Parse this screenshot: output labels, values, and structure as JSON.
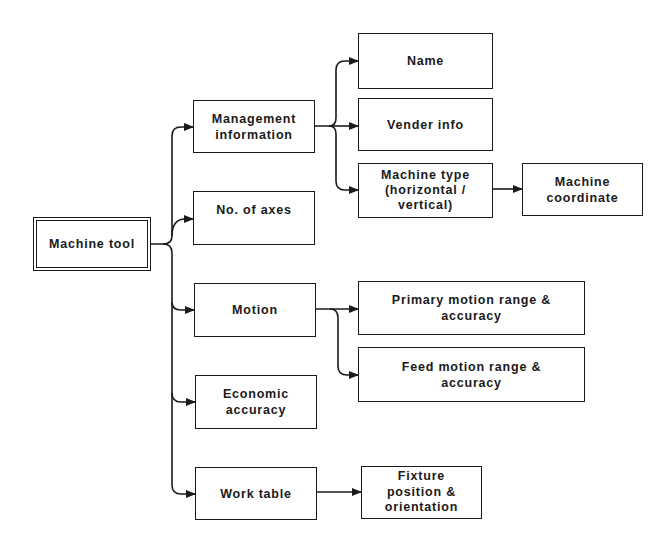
{
  "diagram": {
    "type": "tree",
    "root": "Machine tool",
    "nodes": [
      {
        "id": "machine-tool",
        "label": "Machine tool",
        "x": 33,
        "y": 217,
        "w": 118,
        "h": 54,
        "root": true
      },
      {
        "id": "management-information",
        "label": "Management\ninformation",
        "x": 193,
        "y": 100,
        "w": 122,
        "h": 53
      },
      {
        "id": "no-of-axes",
        "label": "No. of axes",
        "x": 193,
        "y": 191,
        "w": 122,
        "h": 54,
        "valign": "top"
      },
      {
        "id": "motion",
        "label": "Motion",
        "x": 194,
        "y": 283,
        "w": 122,
        "h": 54
      },
      {
        "id": "economic-accuracy",
        "label": "Economic\naccuracy",
        "x": 195,
        "y": 375,
        "w": 122,
        "h": 54
      },
      {
        "id": "work-table",
        "label": "Work table",
        "x": 195,
        "y": 467,
        "w": 122,
        "h": 53
      },
      {
        "id": "name",
        "label": "Name",
        "x": 358,
        "y": 33,
        "w": 135,
        "h": 56
      },
      {
        "id": "vender-info",
        "label": "Vender info",
        "x": 358,
        "y": 98,
        "w": 135,
        "h": 53
      },
      {
        "id": "machine-type",
        "label": "Machine type\n(horizontal /\nvertical)",
        "x": 358,
        "y": 163,
        "w": 135,
        "h": 55
      },
      {
        "id": "machine-coordinate",
        "label": "Machine\ncoordinate",
        "x": 522,
        "y": 163,
        "w": 121,
        "h": 53
      },
      {
        "id": "primary-motion",
        "label": "Primary motion range  &\naccuracy",
        "x": 358,
        "y": 281,
        "w": 227,
        "h": 54
      },
      {
        "id": "feed-motion",
        "label": "Feed motion range  &\naccuracy",
        "x": 358,
        "y": 347,
        "w": 227,
        "h": 55
      },
      {
        "id": "fixture",
        "label": "Fixture\nposition &\norientation",
        "x": 361,
        "y": 466,
        "w": 121,
        "h": 53
      }
    ],
    "edges": [
      {
        "from": "machine-tool",
        "to": "management-information"
      },
      {
        "from": "machine-tool",
        "to": "no-of-axes"
      },
      {
        "from": "machine-tool",
        "to": "motion"
      },
      {
        "from": "machine-tool",
        "to": "economic-accuracy"
      },
      {
        "from": "machine-tool",
        "to": "work-table"
      },
      {
        "from": "management-information",
        "to": "name"
      },
      {
        "from": "management-information",
        "to": "vender-info"
      },
      {
        "from": "management-information",
        "to": "machine-type"
      },
      {
        "from": "machine-type",
        "to": "machine-coordinate"
      },
      {
        "from": "motion",
        "to": "primary-motion"
      },
      {
        "from": "motion",
        "to": "feed-motion"
      },
      {
        "from": "work-table",
        "to": "fixture"
      }
    ],
    "colors": {
      "line": "#1a1a1a",
      "background": "#ffffff"
    }
  }
}
